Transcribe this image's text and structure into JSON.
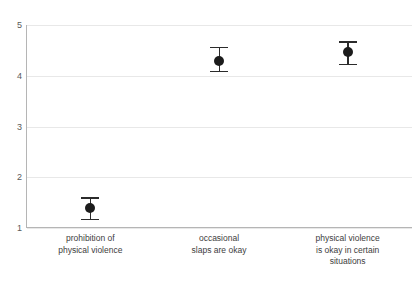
{
  "chart_data": {
    "type": "scatter",
    "title": "",
    "subtitle": "",
    "xlabel": "",
    "ylabel": "",
    "ylim": [
      1,
      5
    ],
    "grid": true,
    "legend": false,
    "legend_position": "none",
    "error_bars": true,
    "categories": [
      "prohibition of physical violence",
      "occasional slaps are okay",
      "physical violence is okay in certain situations"
    ],
    "category_lines": [
      [
        "prohibition of",
        "physical violence"
      ],
      [
        "occasional",
        "slaps are okay"
      ],
      [
        "physical violence",
        "is okay in certain",
        "situations"
      ]
    ],
    "values": [
      1.39,
      4.3,
      4.46
    ],
    "error_low": [
      1.18,
      4.1,
      4.24
    ],
    "error_high": [
      1.61,
      4.57,
      4.68
    ],
    "y_ticks": [
      5,
      4,
      3,
      2,
      1
    ],
    "y_tick_labels": [
      "5",
      "4",
      "3",
      "2",
      "1"
    ],
    "marker_color": "#1c1c1c",
    "errorbar_color": "#2b2b2b",
    "gridline_color": "#e8e8e8",
    "axis_color": "#b5b5b5",
    "background_color": "#ffffff",
    "series_name": ""
  }
}
